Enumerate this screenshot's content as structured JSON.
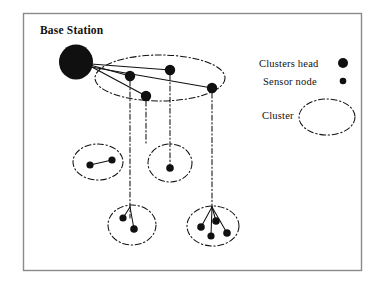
{
  "figure": {
    "background_color": "#ffffff",
    "border_color": "#8a8a8a",
    "ink_color": "#101010"
  },
  "labels": {
    "base_station": "Base Station"
  },
  "legend": {
    "items": [
      {
        "label": "Clusters head",
        "symbol": "large-filled-circle"
      },
      {
        "label": "Sensor node",
        "symbol": "small-filled-circle"
      },
      {
        "label": "Cluster",
        "symbol": "dash-dot-ellipse"
      }
    ]
  },
  "diagram": {
    "base_station": {
      "cx": 76,
      "cy": 62,
      "rx": 17,
      "ry": 17.5,
      "fill": "#101010"
    },
    "uplinks": [
      {
        "from": [
          90,
          65
        ],
        "to": [
          130,
          76
        ]
      },
      {
        "from": [
          90,
          66
        ],
        "to": [
          146,
          96
        ]
      },
      {
        "from": [
          91,
          64
        ],
        "to": [
          170,
          70
        ]
      },
      {
        "from": [
          91,
          67
        ],
        "to": [
          212,
          88
        ]
      }
    ],
    "clusters": [
      {
        "name": "top-cluster",
        "cx": 160,
        "cy": 78,
        "rx": 65,
        "ry": 23
      },
      {
        "name": "mid-left-cluster",
        "cx": 98,
        "cy": 162,
        "rx": 25,
        "ry": 18
      },
      {
        "name": "mid-right-cluster",
        "cx": 170,
        "cy": 163,
        "rx": 22,
        "ry": 19
      },
      {
        "name": "bottom-left-cluster",
        "cx": 132,
        "cy": 225,
        "rx": 24,
        "ry": 20
      },
      {
        "name": "bottom-right-cluster",
        "cx": 213,
        "cy": 226,
        "rx": 26,
        "ry": 20
      }
    ],
    "cluster_heads": [
      {
        "cx": 130,
        "cy": 76,
        "r": 5.2
      },
      {
        "cx": 146,
        "cy": 96,
        "r": 5.2
      },
      {
        "cx": 170,
        "cy": 70,
        "r": 5.2
      },
      {
        "cx": 212,
        "cy": 88,
        "r": 5.2
      }
    ],
    "sensor_nodes": [
      {
        "cx": 90,
        "cy": 165,
        "r": 3.6
      },
      {
        "cx": 112,
        "cy": 160,
        "r": 3.6
      },
      {
        "cx": 170,
        "cy": 168,
        "r": 3.8
      },
      {
        "cx": 123,
        "cy": 218,
        "r": 3.6
      },
      {
        "cx": 134,
        "cy": 229,
        "r": 3.8
      },
      {
        "cx": 201,
        "cy": 227,
        "r": 3.8
      },
      {
        "cx": 216,
        "cy": 221,
        "r": 3.8
      },
      {
        "cx": 211,
        "cy": 236,
        "r": 3.6
      },
      {
        "cx": 227,
        "cy": 233,
        "r": 3.8
      }
    ],
    "backhaul_lines": [
      {
        "x": 130,
        "y1": 81,
        "y2": 218
      },
      {
        "x": 146,
        "y1": 101,
        "y2": 145
      },
      {
        "x": 170,
        "y1": 75,
        "y2": 168
      },
      {
        "x": 212,
        "y1": 93,
        "y2": 207
      }
    ],
    "intra_cluster_links": [
      {
        "from": [
          112,
          160
        ],
        "to": [
          90,
          165
        ]
      },
      {
        "from": [
          130,
          207
        ],
        "to": [
          123,
          218
        ]
      },
      {
        "from": [
          130,
          207
        ],
        "to": [
          134,
          229
        ]
      },
      {
        "from": [
          212,
          207
        ],
        "to": [
          201,
          227
        ]
      },
      {
        "from": [
          212,
          207
        ],
        "to": [
          216,
          221
        ]
      },
      {
        "from": [
          212,
          207
        ],
        "to": [
          211,
          236
        ]
      },
      {
        "from": [
          212,
          207
        ],
        "to": [
          227,
          233
        ]
      }
    ],
    "frame": {
      "x": 23,
      "y": 13,
      "width": 339,
      "height": 258
    }
  }
}
